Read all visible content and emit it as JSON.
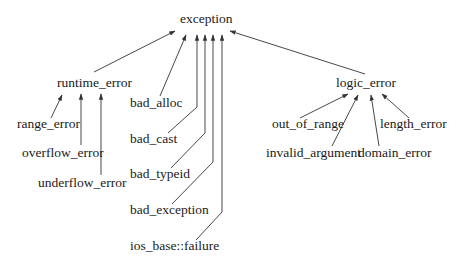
{
  "diagram": {
    "colors": {
      "text": "#1a1a1a",
      "edge": "#333333",
      "background": "#ffffff"
    },
    "nodes": {
      "exception": "exception",
      "runtime_error": "runtime_error",
      "logic_error": "logic_error",
      "bad_alloc": "bad_alloc",
      "bad_cast": "bad_cast",
      "bad_typeid": "bad_typeid",
      "bad_exception": "bad_exception",
      "ios_base_failure": "ios_base::failure",
      "range_error": "range_error",
      "overflow_error": "overflow_error",
      "underflow_error": "underflow_error",
      "out_of_range": "out_of_range",
      "invalid_argument": "invalid_argument",
      "domain_error": "domain_error",
      "length_error": "length_error"
    },
    "edges": [
      {
        "from": "runtime_error",
        "to": "exception"
      },
      {
        "from": "logic_error",
        "to": "exception"
      },
      {
        "from": "bad_alloc",
        "to": "exception"
      },
      {
        "from": "bad_cast",
        "to": "exception"
      },
      {
        "from": "bad_typeid",
        "to": "exception"
      },
      {
        "from": "bad_exception",
        "to": "exception"
      },
      {
        "from": "ios_base::failure",
        "to": "exception"
      },
      {
        "from": "range_error",
        "to": "runtime_error"
      },
      {
        "from": "overflow_error",
        "to": "runtime_error"
      },
      {
        "from": "underflow_error",
        "to": "runtime_error"
      },
      {
        "from": "out_of_range",
        "to": "logic_error"
      },
      {
        "from": "invalid_argument",
        "to": "logic_error"
      },
      {
        "from": "domain_error",
        "to": "logic_error"
      },
      {
        "from": "length_error",
        "to": "logic_error"
      }
    ]
  }
}
